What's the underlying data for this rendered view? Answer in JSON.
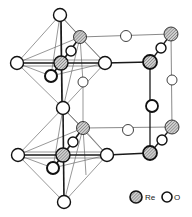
{
  "diagram": {
    "type": "crystal-structure",
    "colors": {
      "bond_dark": "#1a1a1a",
      "bond_light": "#6b6b6b",
      "re_fill": "#b8b8b8",
      "o_fill": "#ffffff",
      "stroke": "#111111"
    },
    "legend": {
      "items": [
        {
          "symbol": "Re",
          "label": "Re",
          "style": "hatched"
        },
        {
          "symbol": "O",
          "label": "O",
          "style": "open"
        }
      ]
    },
    "atoms": [
      {
        "id": "o1",
        "el": "O",
        "x": 60,
        "y": 15,
        "r": 6.5
      },
      {
        "id": "re1b",
        "el": "Re",
        "x": 80,
        "y": 37,
        "r": 6.5
      },
      {
        "id": "o1s",
        "el": "O",
        "x": 71,
        "y": 51,
        "r": 5
      },
      {
        "id": "o1l",
        "el": "O",
        "x": 17,
        "y": 63,
        "r": 6.5
      },
      {
        "id": "re1",
        "el": "Re",
        "x": 61,
        "y": 63,
        "r": 7
      },
      {
        "id": "o1r",
        "el": "O",
        "x": 105,
        "y": 63,
        "r": 6.5
      },
      {
        "id": "o1n",
        "el": "O",
        "x": 51,
        "y": 76,
        "r": 6
      },
      {
        "id": "o1m",
        "el": "O",
        "x": 83,
        "y": 82,
        "r": 5
      },
      {
        "id": "o2",
        "el": "O",
        "x": 63,
        "y": 108,
        "r": 6.5
      },
      {
        "id": "re2b",
        "el": "Re",
        "x": 83,
        "y": 128,
        "r": 6.5
      },
      {
        "id": "o2s",
        "el": "O",
        "x": 73,
        "y": 142,
        "r": 5
      },
      {
        "id": "o2l",
        "el": "O",
        "x": 18,
        "y": 155,
        "r": 6.5
      },
      {
        "id": "re2",
        "el": "Re",
        "x": 63,
        "y": 155,
        "r": 7
      },
      {
        "id": "o2r",
        "el": "O",
        "x": 107,
        "y": 155,
        "r": 6.5
      },
      {
        "id": "o2n",
        "el": "O",
        "x": 53,
        "y": 168,
        "r": 6
      },
      {
        "id": "o3",
        "el": "O",
        "x": 64,
        "y": 202,
        "r": 6.5
      },
      {
        "id": "c_o_top",
        "el": "O",
        "x": 126,
        "y": 36,
        "r": 5.5
      },
      {
        "id": "c_re_tb",
        "el": "Re",
        "x": 171,
        "y": 34,
        "r": 7
      },
      {
        "id": "c_o_ts",
        "el": "O",
        "x": 161,
        "y": 48,
        "r": 5
      },
      {
        "id": "c_re_tf",
        "el": "Re",
        "x": 150,
        "y": 62,
        "r": 7
      },
      {
        "id": "c_o_rb",
        "el": "O",
        "x": 172,
        "y": 80,
        "r": 5
      },
      {
        "id": "c_o_fv",
        "el": "O",
        "x": 152,
        "y": 106,
        "r": 6
      },
      {
        "id": "c_re_bb",
        "el": "Re",
        "x": 172,
        "y": 127,
        "r": 7
      },
      {
        "id": "c_o_mid",
        "el": "O",
        "x": 128,
        "y": 130,
        "r": 5.5
      },
      {
        "id": "c_o_bs",
        "el": "O",
        "x": 162,
        "y": 140,
        "r": 5
      },
      {
        "id": "c_re_bf",
        "el": "Re",
        "x": 150,
        "y": 153,
        "r": 7
      }
    ]
  }
}
